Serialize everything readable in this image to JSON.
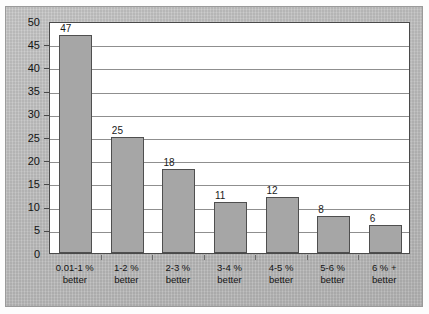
{
  "chart_data": {
    "type": "bar",
    "title": "",
    "subtitle": "",
    "xlabel": "",
    "ylabel": "",
    "ylim": [
      0,
      50
    ],
    "ytick_step": 5,
    "yticks": [
      "50",
      "45",
      "40",
      "35",
      "30",
      "25",
      "20",
      "15",
      "10",
      "5",
      "0"
    ],
    "grid": true,
    "legend": "none",
    "categories": [
      "0.01-1 %\nbetter",
      "1-2 %\nbetter",
      "2-3 %\nbetter",
      "3-4 %\nbetter",
      "4-5 %\nbetter",
      "5-6 %\nbetter",
      "6 % +\nbetter"
    ],
    "category_lines": [
      {
        "line1": "0.01-1 %",
        "line2": "better"
      },
      {
        "line1": "1-2 %",
        "line2": "better"
      },
      {
        "line1": "2-3 %",
        "line2": "better"
      },
      {
        "line1": "3-4 %",
        "line2": "better"
      },
      {
        "line1": "4-5 %",
        "line2": "better"
      },
      {
        "line1": "5-6 %",
        "line2": "better"
      },
      {
        "line1": "6 % +",
        "line2": "better"
      }
    ],
    "values": [
      47,
      25,
      18,
      11,
      12,
      8,
      6
    ],
    "value_labels": [
      "47",
      "25",
      "18",
      "11",
      "12",
      "8",
      "6"
    ]
  },
  "colors": {
    "bar_fill": "#a6a6a6",
    "bar_stroke": "#4f4f4f",
    "plot_background": "#ffffff",
    "plot_border": "#4a4a4a",
    "gridline": "#8f8f8f",
    "panel_background": "#b9b9b9",
    "page_background": "#fdfdfd",
    "text": "#141414"
  }
}
